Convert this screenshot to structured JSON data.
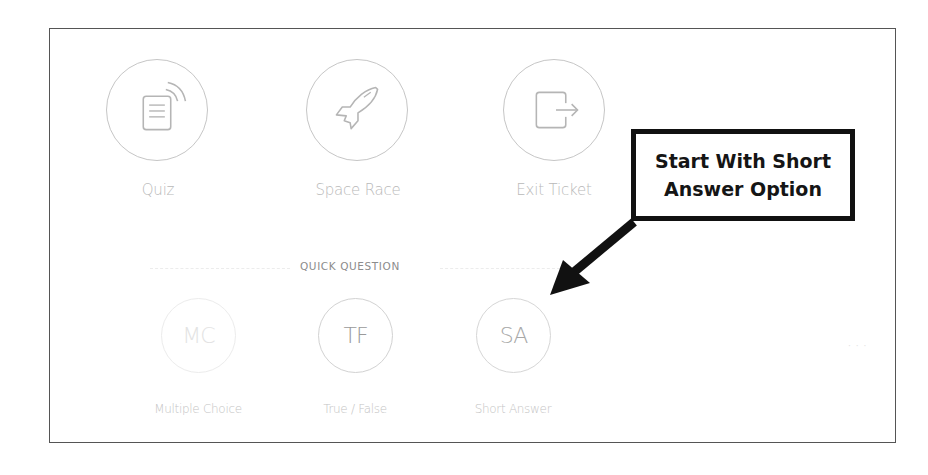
{
  "activities": [
    {
      "id": "quiz",
      "label": "Quiz",
      "icon": "quiz-document-signal-icon"
    },
    {
      "id": "space-race",
      "label": "Space Race",
      "icon": "rocket-icon"
    },
    {
      "id": "exit-ticket",
      "label": "Exit Ticket",
      "icon": "exit-door-arrow-icon"
    }
  ],
  "quick_question": {
    "title": "QUICK QUESTION",
    "options": [
      {
        "id": "mc",
        "abbr": "MC",
        "label": "Multiple Choice",
        "color": "#e3e3e3"
      },
      {
        "id": "tf",
        "abbr": "TF",
        "label": "True / False",
        "color": "#9a9a9a"
      },
      {
        "id": "sa",
        "abbr": "SA",
        "label": "Short Answer",
        "color": "#a8a8a8"
      }
    ]
  },
  "annotation": {
    "line1": "Start With Short",
    "line2": "Answer Option",
    "points_to": "Short Answer"
  },
  "colors": {
    "frame_border": "#555555",
    "circle_border": "#c6c6c6",
    "label_text": "#b9b9b9",
    "annotation": "#111111"
  }
}
